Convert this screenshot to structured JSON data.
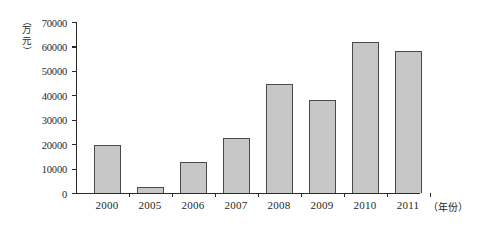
{
  "chart_data": {
    "type": "bar",
    "title": "",
    "subtitle": "",
    "xlabel": "（年份）",
    "ylabel": "（万元）",
    "categories": [
      "2000",
      "2005",
      "2006",
      "2007",
      "2008",
      "2009",
      "2010",
      "2011"
    ],
    "values": [
      19500,
      2500,
      12500,
      22500,
      44500,
      38000,
      62000,
      58000
    ],
    "series": [
      {
        "name": "",
        "values": [
          19500,
          2500,
          12500,
          22500,
          44500,
          38000,
          62000,
          58000
        ]
      }
    ],
    "ylim": [
      0,
      70000
    ],
    "ytick_labels": [
      "0",
      "10000",
      "20000",
      "30000",
      "40000",
      "50000",
      "60000",
      "70000"
    ],
    "ytick_values": [
      0,
      10000,
      20000,
      30000,
      40000,
      50000,
      60000,
      70000
    ],
    "grid": false,
    "legend": false,
    "legend_position": "none",
    "annotations": []
  },
  "axis": {
    "y_unit_open_paren": "（",
    "y_unit_char1": "万",
    "y_unit_char2": "元",
    "y_unit_close_paren": "）",
    "x_title": "（年份）"
  },
  "colors": {
    "bar_fill": "#c7c7c7",
    "bar_border": "#4a4a4a",
    "axis": "#2b2b2b",
    "text": "#1f1f1f",
    "background": "#ffffff"
  }
}
